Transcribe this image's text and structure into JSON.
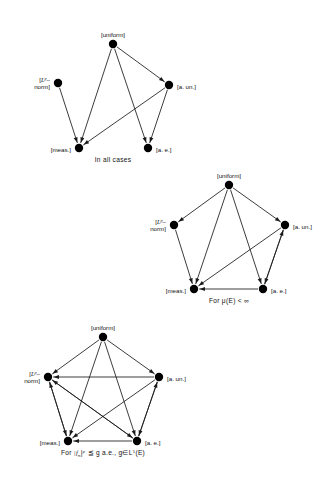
{
  "figure": {
    "node_labels": {
      "uniform": "[uniform]",
      "lp_norm_line1": "[L",
      "lp_norm_sup": "p",
      "lp_norm_dash": "–",
      "lp_norm_line2": "norm]",
      "a_un": "[a. un.]",
      "meas": "[meas.]",
      "a_e": "[a. e.]"
    },
    "diagrams": [
      {
        "id": "diagram-1",
        "caption": "In all cases",
        "nodes": [
          {
            "key": "uniform",
            "label": "[uniform]",
            "x": 113,
            "y": 44,
            "label_dx": 0,
            "label_dy": -9,
            "anchor": "middle"
          },
          {
            "key": "lp",
            "label": "[L p - norm]",
            "x": 58,
            "y": 83,
            "label_dx": -8,
            "label_dy": 0,
            "anchor": "end"
          },
          {
            "key": "aun",
            "label": "[a. un.]",
            "x": 169,
            "y": 85,
            "label_dx": 8,
            "label_dy": 2,
            "anchor": "start"
          },
          {
            "key": "meas",
            "label": "[meas.]",
            "x": 79,
            "y": 148,
            "label_dx": -8,
            "label_dy": 2,
            "anchor": "end"
          },
          {
            "key": "ae",
            "label": "[a. e.]",
            "x": 148,
            "y": 148,
            "label_dx": 8,
            "label_dy": 2,
            "anchor": "start"
          }
        ],
        "edges": [
          {
            "from": "uniform",
            "to": "meas"
          },
          {
            "from": "uniform",
            "to": "ae"
          },
          {
            "from": "uniform",
            "to": "aun"
          },
          {
            "from": "lp",
            "to": "meas"
          },
          {
            "from": "aun",
            "to": "meas"
          },
          {
            "from": "aun",
            "to": "ae"
          }
        ]
      },
      {
        "id": "diagram-2",
        "caption": "For μ(E) < ∞",
        "nodes": [
          {
            "key": "uniform",
            "label": "[uniform]",
            "x": 229,
            "y": 185,
            "label_dx": 0,
            "label_dy": -9,
            "anchor": "middle"
          },
          {
            "key": "lp",
            "label": "[L p - norm]",
            "x": 174,
            "y": 225,
            "label_dx": -8,
            "label_dy": 0,
            "anchor": "end"
          },
          {
            "key": "aun",
            "label": "[a. un.]",
            "x": 285,
            "y": 225,
            "label_dx": 8,
            "label_dy": 2,
            "anchor": "start"
          },
          {
            "key": "meas",
            "label": "[meas.]",
            "x": 194,
            "y": 289,
            "label_dx": -8,
            "label_dy": 2,
            "anchor": "end"
          },
          {
            "key": "ae",
            "label": "[a. e.]",
            "x": 263,
            "y": 289,
            "label_dx": 8,
            "label_dy": 2,
            "anchor": "start"
          }
        ],
        "edges": [
          {
            "from": "uniform",
            "to": "lp"
          },
          {
            "from": "uniform",
            "to": "aun"
          },
          {
            "from": "uniform",
            "to": "meas"
          },
          {
            "from": "uniform",
            "to": "ae"
          },
          {
            "from": "lp",
            "to": "meas"
          },
          {
            "from": "aun",
            "to": "meas"
          },
          {
            "from": "aun",
            "to": "ae"
          },
          {
            "from": "ae",
            "to": "aun"
          },
          {
            "from": "ae",
            "to": "meas"
          }
        ]
      },
      {
        "id": "diagram-3",
        "caption": "For |f n| p ≦ g a.e., g∈L¹(E)",
        "nodes": [
          {
            "key": "uniform",
            "label": "[uniform]",
            "x": 103,
            "y": 337,
            "label_dx": 0,
            "label_dy": -9,
            "anchor": "middle"
          },
          {
            "key": "lp",
            "label": "[L p - norm]",
            "x": 48,
            "y": 377,
            "label_dx": -8,
            "label_dy": 0,
            "anchor": "end"
          },
          {
            "key": "aun",
            "label": "[a. un.]",
            "x": 159,
            "y": 377,
            "label_dx": 8,
            "label_dy": 2,
            "anchor": "start"
          },
          {
            "key": "meas",
            "label": "[meas.]",
            "x": 68,
            "y": 441,
            "label_dx": -8,
            "label_dy": 2,
            "anchor": "end"
          },
          {
            "key": "ae",
            "label": "[a. e.]",
            "x": 137,
            "y": 441,
            "label_dx": 8,
            "label_dy": 2,
            "anchor": "start"
          }
        ],
        "edges": [
          {
            "from": "uniform",
            "to": "lp"
          },
          {
            "from": "uniform",
            "to": "aun"
          },
          {
            "from": "uniform",
            "to": "meas"
          },
          {
            "from": "uniform",
            "to": "ae"
          },
          {
            "from": "aun",
            "to": "lp"
          },
          {
            "from": "ae",
            "to": "lp"
          },
          {
            "from": "meas",
            "to": "lp"
          },
          {
            "from": "lp",
            "to": "meas"
          },
          {
            "from": "lp",
            "to": "ae"
          },
          {
            "from": "aun",
            "to": "meas"
          },
          {
            "from": "aun",
            "to": "ae"
          },
          {
            "from": "ae",
            "to": "aun"
          },
          {
            "from": "ae",
            "to": "meas"
          }
        ]
      }
    ],
    "captions": {
      "c1": "In all cases",
      "c2_prefix": "For",
      "c2_mu": "μ(E)",
      "c2_rel": "<",
      "c2_inf": "∞",
      "c3_prefix": "For",
      "c3_abs_open": "|f",
      "c3_sub": "n",
      "c3_abs_close": "|",
      "c3_sup": "p",
      "c3_rel": "≦",
      "c3_rest": "g a.e., g∈L",
      "c3_sup2": "1",
      "c3_end": "(E)"
    },
    "caption_positions": [
      {
        "x": 113,
        "y": 162
      },
      {
        "x": 229,
        "y": 303
      },
      {
        "x": 103,
        "y": 455
      }
    ],
    "style": {
      "node_color": "#000000",
      "node_radius": 4.2,
      "edge_color": "#1a1a1a",
      "background": "#ffffff"
    }
  }
}
